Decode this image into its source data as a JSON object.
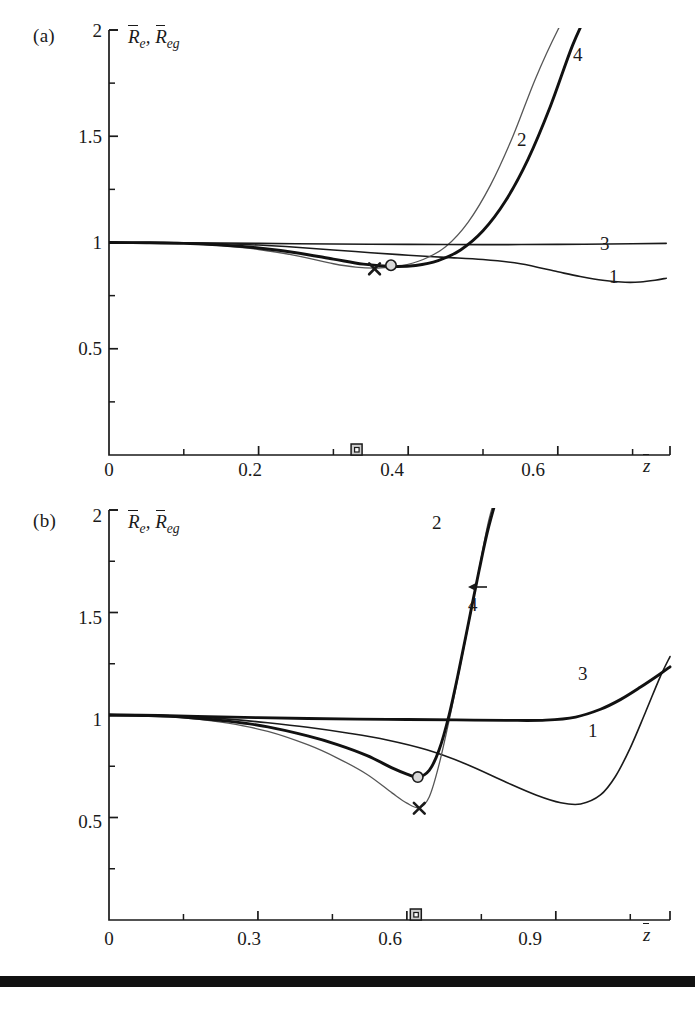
{
  "figure": {
    "background": "#ffffff",
    "ink": "#1a1a1a",
    "thin_curve_color": "#565656",
    "thick_curve_color": "#111111",
    "bottom_bar_color": "#111111"
  },
  "panels": [
    {
      "id": "a",
      "label": "(a)",
      "axis_title": "R̄e, R̄eg",
      "axis_title_main": "R",
      "axis_title_sub1": "e",
      "axis_title_sub2": "eg",
      "xaxis_title": "z̄",
      "xticks": [
        "0",
        "0.2",
        "0.4",
        "0.6"
      ],
      "xtick_values": [
        0,
        0.2,
        0.4,
        0.6
      ],
      "xminor_values": [
        0.1,
        0.3,
        0.5,
        0.7
      ],
      "yticks": [
        "2",
        "1.5",
        "1",
        "0.5"
      ],
      "ytick_values": [
        2,
        1.5,
        1,
        0.5
      ],
      "yminor_values": [
        1.75,
        1.25,
        0.75,
        0.25
      ],
      "xlim": [
        0,
        0.75
      ],
      "ylim": [
        0,
        2
      ],
      "curve_labels": [
        {
          "text": "4",
          "x": 0.645,
          "y": 1.88
        },
        {
          "text": "2",
          "x": 0.578,
          "y": 1.48
        },
        {
          "text": "3",
          "x": 0.672,
          "y": 1.06
        },
        {
          "text": "1",
          "x": 0.683,
          "y": 0.905
        }
      ],
      "markers": {
        "cross": {
          "x": 0.355,
          "y": 0.876,
          "symbol": "x"
        },
        "circle": {
          "x": 0.377,
          "y": 0.893,
          "symbol": "o"
        },
        "axis_square": {
          "x": 0.331,
          "symbol": "square"
        }
      }
    },
    {
      "id": "b",
      "label": "(b)",
      "axis_title": "R̄e, R̄eg",
      "axis_title_main": "R",
      "axis_title_sub1": "e",
      "axis_title_sub2": "eg",
      "xaxis_title": "z̄",
      "xticks": [
        "0",
        "0.3",
        "0.6",
        "0.9"
      ],
      "xtick_values": [
        0,
        0.3,
        0.6,
        0.9
      ],
      "xminor_values": [
        0.15,
        0.45,
        0.75,
        1.05
      ],
      "yticks": [
        "2",
        "1.5",
        "1",
        "0.5"
      ],
      "ytick_values": [
        2,
        1.5,
        1,
        0.5
      ],
      "yminor_values": [
        1.75,
        1.25,
        0.75,
        0.25
      ],
      "xlim": [
        0,
        1.13
      ],
      "ylim": [
        0,
        2
      ],
      "curve_labels": [
        {
          "text": "2",
          "x": 0.655,
          "y": 1.9
        },
        {
          "text": "4",
          "x": 0.745,
          "y": 1.625,
          "arrow": true
        },
        {
          "text": "3",
          "x": 0.965,
          "y": 1.12
        },
        {
          "text": "1",
          "x": 0.985,
          "y": 0.845
        }
      ],
      "markers": {
        "cross": {
          "x": 0.625,
          "y": 0.545,
          "symbol": "x"
        },
        "circle": {
          "x": 0.622,
          "y": 0.697,
          "symbol": "o"
        },
        "axis_square": {
          "x": 0.618,
          "symbol": "square"
        }
      }
    }
  ],
  "chart_data": [
    {
      "type": "line",
      "panel": "a",
      "title": "",
      "xlabel": "z̄",
      "ylabel": "R̄e, R̄eg",
      "xlim": [
        0,
        0.75
      ],
      "ylim": [
        0,
        2
      ],
      "grid": false,
      "legend": "inline curve numbers",
      "xticks": [
        0,
        0.2,
        0.4,
        0.6
      ],
      "yticks": [
        0.5,
        1,
        1.5,
        2
      ],
      "series": [
        {
          "name": "1",
          "style": "thin-dark",
          "x": [
            0.0,
            0.05,
            0.1,
            0.15,
            0.2,
            0.25,
            0.3,
            0.35,
            0.4,
            0.45,
            0.5,
            0.55,
            0.6,
            0.63,
            0.66,
            0.69,
            0.71,
            0.73,
            0.745
          ],
          "y": [
            1.0,
            1.0,
            0.998,
            0.994,
            0.988,
            0.978,
            0.965,
            0.952,
            0.94,
            0.93,
            0.92,
            0.9,
            0.862,
            0.84,
            0.822,
            0.813,
            0.814,
            0.822,
            0.832
          ]
        },
        {
          "name": "2",
          "style": "thin-grey",
          "x": [
            0.0,
            0.05,
            0.1,
            0.15,
            0.2,
            0.25,
            0.3,
            0.33,
            0.36,
            0.39,
            0.42,
            0.45,
            0.48,
            0.51,
            0.54,
            0.57,
            0.6,
            0.62
          ],
          "y": [
            1.0,
            0.999,
            0.995,
            0.985,
            0.967,
            0.938,
            0.9,
            0.884,
            0.88,
            0.89,
            0.92,
            0.98,
            1.095,
            1.27,
            1.5,
            1.77,
            2.0,
            2.12
          ]
        },
        {
          "name": "3",
          "style": "thin-dark",
          "x": [
            0.0,
            0.1,
            0.2,
            0.3,
            0.4,
            0.5,
            0.6,
            0.7,
            0.745
          ],
          "y": [
            1.0,
            0.999,
            0.996,
            0.993,
            0.991,
            0.99,
            0.991,
            0.994,
            0.996
          ]
        },
        {
          "name": "4",
          "style": "thick-dark",
          "x": [
            0.0,
            0.05,
            0.1,
            0.15,
            0.2,
            0.25,
            0.3,
            0.34,
            0.38,
            0.41,
            0.44,
            0.47,
            0.5,
            0.53,
            0.56,
            0.59,
            0.62,
            0.645
          ],
          "y": [
            1.0,
            0.999,
            0.996,
            0.988,
            0.974,
            0.952,
            0.922,
            0.898,
            0.887,
            0.892,
            0.915,
            0.965,
            1.055,
            1.195,
            1.39,
            1.64,
            1.93,
            2.12
          ]
        }
      ],
      "markers": [
        {
          "symbol": "x",
          "x": 0.355,
          "y": 0.876
        },
        {
          "symbol": "o",
          "x": 0.377,
          "y": 0.893
        },
        {
          "symbol": "square-on-axis",
          "x": 0.331,
          "y": 0.0
        }
      ]
    },
    {
      "type": "line",
      "panel": "b",
      "title": "",
      "xlabel": "z̄",
      "ylabel": "R̄e, R̄eg",
      "xlim": [
        0,
        1.13
      ],
      "ylim": [
        0,
        2
      ],
      "grid": false,
      "legend": "inline curve numbers",
      "xticks": [
        0,
        0.3,
        0.6,
        0.9
      ],
      "yticks": [
        0.5,
        1,
        1.5,
        2
      ],
      "series": [
        {
          "name": "1",
          "style": "thin-dark",
          "x": [
            0.0,
            0.08,
            0.16,
            0.24,
            0.32,
            0.4,
            0.48,
            0.56,
            0.64,
            0.72,
            0.8,
            0.86,
            0.91,
            0.95,
            0.99,
            1.02,
            1.05,
            1.08,
            1.11,
            1.13
          ],
          "y": [
            1.0,
            0.998,
            0.992,
            0.98,
            0.962,
            0.94,
            0.912,
            0.878,
            0.83,
            0.76,
            0.672,
            0.61,
            0.572,
            0.566,
            0.61,
            0.7,
            0.84,
            1.01,
            1.185,
            1.285
          ]
        },
        {
          "name": "2",
          "style": "thin-grey",
          "x": [
            0.0,
            0.08,
            0.16,
            0.24,
            0.32,
            0.4,
            0.46,
            0.52,
            0.57,
            0.6,
            0.625,
            0.645,
            0.665,
            0.69,
            0.715,
            0.74,
            0.765,
            0.79
          ],
          "y": [
            1.0,
            0.996,
            0.984,
            0.96,
            0.92,
            0.855,
            0.79,
            0.71,
            0.62,
            0.57,
            0.548,
            0.6,
            0.76,
            1.03,
            1.33,
            1.64,
            1.95,
            2.15
          ]
        },
        {
          "name": "3",
          "style": "thick-dark",
          "x": [
            0.0,
            0.1,
            0.2,
            0.3,
            0.4,
            0.5,
            0.6,
            0.7,
            0.8,
            0.88,
            0.94,
            0.99,
            1.03,
            1.07,
            1.11,
            1.13
          ],
          "y": [
            1.0,
            0.998,
            0.992,
            0.987,
            0.983,
            0.98,
            0.978,
            0.976,
            0.974,
            0.975,
            0.99,
            1.028,
            1.075,
            1.135,
            1.2,
            1.235
          ]
        },
        {
          "name": "4",
          "style": "thick-dark",
          "x": [
            0.0,
            0.08,
            0.16,
            0.24,
            0.32,
            0.4,
            0.46,
            0.52,
            0.57,
            0.6,
            0.622,
            0.645,
            0.665,
            0.685,
            0.705,
            0.725,
            0.745,
            0.765,
            0.79,
            0.815
          ],
          "y": [
            1.0,
            0.997,
            0.988,
            0.97,
            0.942,
            0.898,
            0.856,
            0.802,
            0.742,
            0.712,
            0.697,
            0.73,
            0.83,
            1.0,
            1.22,
            1.46,
            1.7,
            1.92,
            2.12,
            2.22
          ]
        }
      ],
      "markers": [
        {
          "symbol": "x",
          "x": 0.625,
          "y": 0.545
        },
        {
          "symbol": "o",
          "x": 0.622,
          "y": 0.697
        },
        {
          "symbol": "square-on-axis",
          "x": 0.618,
          "y": 0.0
        }
      ]
    }
  ]
}
